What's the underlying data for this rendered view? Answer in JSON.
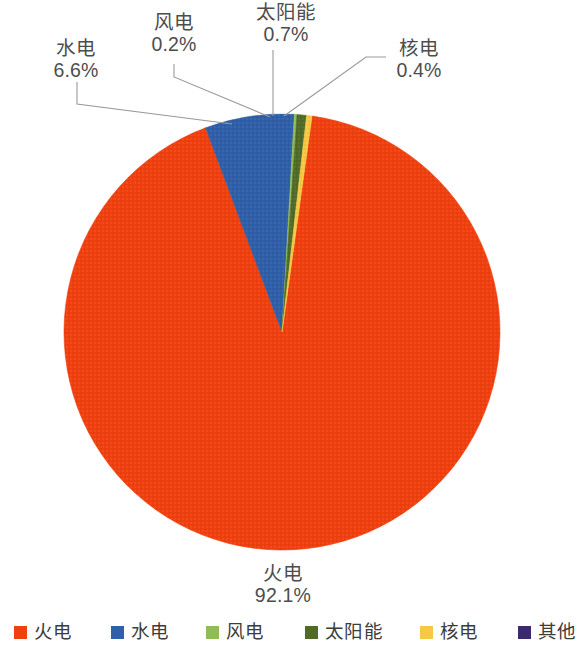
{
  "chart_data": {
    "type": "pie",
    "title": "",
    "subtitle": "",
    "xlabel": "",
    "ylabel": "",
    "grid": false,
    "legend_position": "bottom",
    "units": "%",
    "start_angle_deg": 0,
    "direction": "clockwise",
    "center": {
      "x": 282,
      "y": 332
    },
    "radius": 218,
    "categories": [
      "火电",
      "水电",
      "风电",
      "太阳能",
      "核电",
      "其他"
    ],
    "values": [
      92.1,
      6.6,
      0.2,
      0.7,
      0.4,
      0.0
    ],
    "value_labels": [
      "92.1%",
      "6.6%",
      "0.2%",
      "0.7%",
      "0.4%",
      ""
    ],
    "colors": [
      "#F0400F",
      "#2F5FA8",
      "#8FBC55",
      "#4F6B27",
      "#F7C843",
      "#3B2A6E"
    ],
    "slices": [
      {
        "name": "火电",
        "value": 92.1,
        "label": "92.1%",
        "color": "#F0400F",
        "start_deg": 7.92,
        "end_deg": 339.48
      },
      {
        "name": "水电",
        "value": 6.6,
        "label": "6.6%",
        "color": "#2F5FA8",
        "start_deg": 339.48,
        "end_deg": 363.24
      },
      {
        "name": "风电",
        "value": 0.2,
        "label": "0.2%",
        "color": "#8FBC55",
        "start_deg": 363.24,
        "end_deg": 363.96
      },
      {
        "name": "太阳能",
        "value": 0.7,
        "label": "0.7%",
        "color": "#4F6B27",
        "start_deg": 363.96,
        "end_deg": 366.48
      },
      {
        "name": "核电",
        "value": 0.4,
        "label": "0.4%",
        "color": "#F7C843",
        "start_deg": 366.48,
        "end_deg": 367.92
      },
      {
        "name": "其他",
        "value": 0.0,
        "label": "",
        "color": "#3B2A6E",
        "start_deg": 367.92,
        "end_deg": 367.92
      }
    ]
  },
  "callouts": {
    "hydro": {
      "category": "水电",
      "percent": "6.6%"
    },
    "wind": {
      "category": "风电",
      "percent": "0.2%"
    },
    "solar": {
      "category": "太阳能",
      "percent": "0.7%"
    },
    "nuclear": {
      "category": "核电",
      "percent": "0.4%"
    },
    "thermal": {
      "category": "火电",
      "percent": "92.1%"
    }
  },
  "legend": {
    "items": [
      {
        "label": "火电",
        "color": "#F0400F"
      },
      {
        "label": "水电",
        "color": "#2F5FA8"
      },
      {
        "label": "风电",
        "color": "#8FBC55"
      },
      {
        "label": "太阳能",
        "color": "#4F6B27"
      },
      {
        "label": "核电",
        "color": "#F7C843"
      },
      {
        "label": "其他",
        "color": "#3B2A6E"
      }
    ]
  }
}
